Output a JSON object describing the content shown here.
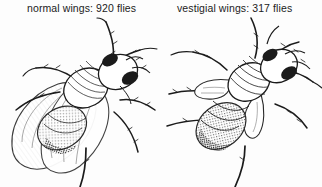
{
  "figure": {
    "background_color": "#fdfdfd",
    "ink_color": "#1b1b1b",
    "style": "pen-and-ink stipple engraving"
  },
  "panels": [
    {
      "id": "normal",
      "caption": "normal wings: 920 flies",
      "phenotype_label": "normal wings",
      "count_label": "920 flies",
      "count": 920,
      "wing_type": "long normal wings",
      "fly_name": "fruit-fly-normal-wings"
    },
    {
      "id": "vestigial",
      "caption": "vestigial wings: 317 flies",
      "phenotype_label": "vestigial wings",
      "count_label": "317 flies",
      "count": 317,
      "wing_type": "short stubby vestigial wings",
      "fly_name": "fruit-fly-vestigial-wings"
    }
  ]
}
